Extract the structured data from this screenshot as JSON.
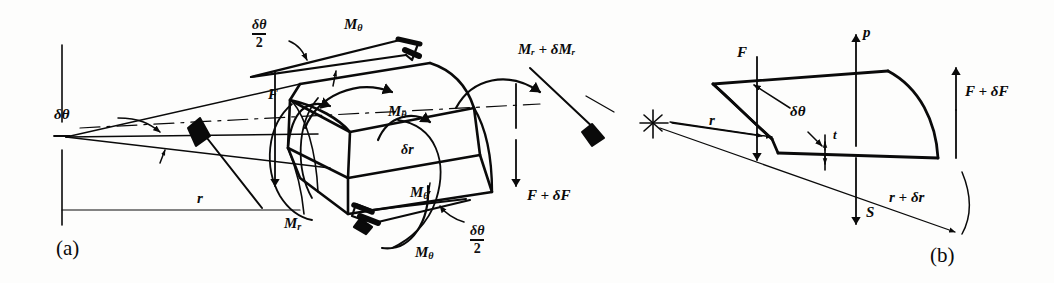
{
  "figure": {
    "background_color": "#fdfdfc",
    "ink_color": "#0a0a0a",
    "panels": [
      {
        "id": "a",
        "caption": "(a)",
        "description": "Three-dimensional sector element of a circular plate showing radial and circumferential bending moments"
      },
      {
        "id": "b",
        "caption": "(b)",
        "description": "Radial cross-section of the plate element showing shear forces, pressure and thickness"
      }
    ]
  },
  "panel_a": {
    "caption": "(a)",
    "labels": {
      "delta_theta": "δθ",
      "radius": "r",
      "moment_radial": "M",
      "moment_radial_sub": "r",
      "moment_theta": "M",
      "moment_theta_sub": "θ",
      "moment_radial_increment": "Mᵣ + δMᵣ",
      "force_f": "F",
      "force_f_increment": "F + δF",
      "delta_r": "δr",
      "half_angle_numerator": "δθ",
      "half_angle_denominator": "2"
    },
    "annotations": [
      {
        "name": "delta-theta-angle",
        "text": "δθ"
      },
      {
        "name": "radius-dimension",
        "text": "r"
      },
      {
        "name": "radial-moment",
        "text": "Mᵣ"
      },
      {
        "name": "circumferential-moment-top",
        "text": "Mθ"
      },
      {
        "name": "circumferential-moment-mid",
        "text": "Mθ"
      },
      {
        "name": "circumferential-moment-bottom",
        "text": "Mθ"
      },
      {
        "name": "circumferential-moment-vector",
        "text": "Mθ"
      },
      {
        "name": "radial-moment-increment",
        "text": "Mᵣ + δMᵣ"
      },
      {
        "name": "shear-force",
        "text": "F"
      },
      {
        "name": "shear-force-increment",
        "text": "F + δF"
      },
      {
        "name": "radial-element-width",
        "text": "δr"
      },
      {
        "name": "half-angle-upper",
        "text": "δθ/2"
      },
      {
        "name": "half-angle-lower",
        "text": "δθ/2"
      }
    ]
  },
  "panel_b": {
    "caption": "(b)",
    "labels": {
      "force_f": "F",
      "pressure": "p",
      "force_f_increment": "F + δF",
      "delta_theta": "δθ",
      "radius": "r",
      "thickness": "t",
      "shear_s": "S",
      "radius_increment": "r + δr"
    },
    "annotations": [
      {
        "name": "force-f",
        "text": "F"
      },
      {
        "name": "pressure-p",
        "text": "p"
      },
      {
        "name": "force-f-increment",
        "text": "F + δF"
      },
      {
        "name": "delta-theta-angle",
        "text": "δθ"
      },
      {
        "name": "inner-radius",
        "text": "r"
      },
      {
        "name": "plate-thickness",
        "text": "t"
      },
      {
        "name": "shear-force-s",
        "text": "S"
      },
      {
        "name": "outer-radius",
        "text": "r + δr"
      }
    ]
  }
}
